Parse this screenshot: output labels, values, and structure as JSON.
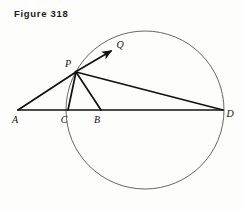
{
  "figure": {
    "caption": "Figure 318",
    "background_color": "#fdfdfb",
    "line_color": "#111111",
    "circle_color": "#555555"
  },
  "diagram": {
    "type": "euclidean-geometry",
    "circle": {
      "cx": 145,
      "cy": 110,
      "r": 79
    },
    "points": [
      {
        "name": "A",
        "x": 18,
        "y": 110,
        "label": "A",
        "label_x": 15,
        "label_y": 123,
        "on_circle": false
      },
      {
        "name": "C",
        "x": 68,
        "y": 110,
        "label": "C",
        "label_x": 64,
        "label_y": 123,
        "on_circle": true
      },
      {
        "name": "B",
        "x": 101,
        "y": 110,
        "label": "B",
        "label_x": 97,
        "label_y": 123,
        "on_circle": false
      },
      {
        "name": "D",
        "x": 223,
        "y": 110,
        "label": "D",
        "label_x": 228,
        "label_y": 117,
        "on_circle": true
      },
      {
        "name": "P",
        "x": 76,
        "y": 72,
        "label": "P",
        "label_x": 68,
        "label_y": 67,
        "on_circle": true
      },
      {
        "name": "Q",
        "x": 114,
        "y": 49,
        "label": "Q",
        "label_x": 118,
        "label_y": 48,
        "on_circle": false
      }
    ],
    "segments": [
      {
        "name": "baseline-AD",
        "from": "A",
        "to": "D"
      },
      {
        "name": "segment-AP",
        "from": "A",
        "to": "P"
      },
      {
        "name": "segment-PC",
        "from": "P",
        "to": "C"
      },
      {
        "name": "segment-PB",
        "from": "P",
        "to": "B"
      },
      {
        "name": "segment-PD",
        "from": "P",
        "to": "D"
      }
    ],
    "rays": [
      {
        "name": "ray-PQ",
        "from": "P",
        "to": "Q",
        "arrowhead": true
      }
    ]
  }
}
